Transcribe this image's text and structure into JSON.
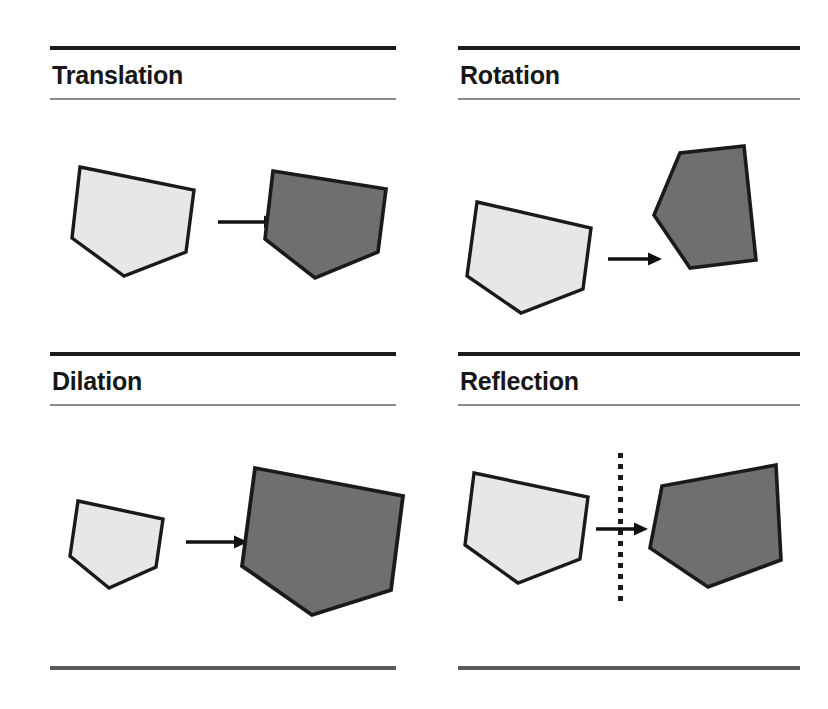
{
  "page": {
    "width": 828,
    "height": 709,
    "background": "#ffffff"
  },
  "colors": {
    "ink": "#1c1c1c",
    "rule_thin": "#8a8a8a",
    "rule_bottom": "#5a5a5a",
    "shape_light_fill": "#e7e7e7",
    "shape_dark_fill": "#6f6f6f",
    "shape_outline": "#1a1a1a",
    "arrow": "#111111",
    "mirror_line": "#1a1a1a"
  },
  "panels": [
    {
      "id": "translation",
      "title": "Translation",
      "arrow_label": "maps-to-arrow",
      "source_shape": "pentagon-light",
      "target_shape": "pentagon-dark",
      "mirror_line": false
    },
    {
      "id": "rotation",
      "title": "Rotation",
      "arrow_label": "maps-to-arrow",
      "source_shape": "pentagon-light",
      "target_shape": "pentagon-dark-rotated",
      "mirror_line": false
    },
    {
      "id": "dilation",
      "title": "Dilation",
      "arrow_label": "maps-to-arrow",
      "source_shape": "pentagon-light-small",
      "target_shape": "pentagon-dark-enlarged",
      "mirror_line": false
    },
    {
      "id": "reflection",
      "title": "Reflection",
      "arrow_label": "maps-to-arrow",
      "source_shape": "pentagon-light",
      "target_shape": "pentagon-dark-mirrored",
      "mirror_line": true
    }
  ],
  "geometry": {
    "translation": {
      "light_points": "16,17 130,40 122,102 60,126 8,88",
      "dark_points": "11,21 124,39 116,102 53,128 3,89",
      "arrow": {
        "x1": 6,
        "y1": 12,
        "x2": 62,
        "y2": 12
      }
    },
    "rotation": {
      "light_points": "21,16 135,42 127,103 65,127 11,90",
      "dark_points": "116,4 52,11 26,73 62,126 128,118",
      "arrow": {
        "x1": 6,
        "y1": 12,
        "x2": 62,
        "y2": 12
      }
    },
    "dilation": {
      "light_points": "14,13 99,31 92,79 45,100 6,68",
      "dark_points": "19,14 167,42 155,136 76,161 6,112",
      "arrow": {
        "x1": 6,
        "y1": 12,
        "x2": 68,
        "y2": 12
      }
    },
    "reflection": {
      "light_points": "18,17 132,41 124,103 62,127 9,89",
      "dark_points": "122,9 24,30 12,92 70,131 123,104",
      "arrow": {
        "x1": 6,
        "y1": 12,
        "x2": 62,
        "y2": 12
      },
      "mirror": {
        "x": 620,
        "y_top": 453,
        "y_bottom": 606
      }
    }
  }
}
